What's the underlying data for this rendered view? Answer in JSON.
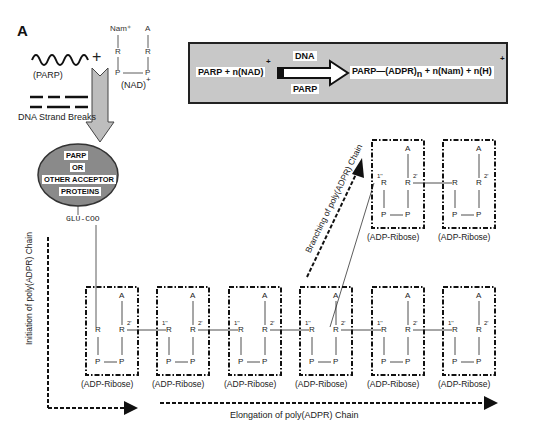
{
  "panel": {
    "letter": "A"
  },
  "reactants": {
    "parp_label": "(PARP)",
    "plus": "+",
    "nad_label": "(NAD)",
    "nad_charge": "+",
    "nad_structure": {
      "top_left": "Nam⁺",
      "top_right": "A",
      "mid_left": "R",
      "mid_right": "R",
      "bot_left": "P",
      "bot_right": "P"
    },
    "dna_breaks_label": "DNA Strand Breaks"
  },
  "reaction": {
    "left": "PARP + n(NAD)",
    "left_charge": "+",
    "arrow_top": "DNA",
    "arrow_bottom": "PARP",
    "right_main": "PARP—(ADPR)",
    "right_sub": "n",
    "right_rest": "+ n(Nam) + n(H)",
    "right_charge": "+"
  },
  "acceptor": {
    "lines": [
      "PARP",
      "OR",
      "OTHER ACCEPTOR",
      "PROTEINS"
    ],
    "attachment": "GLU-COO"
  },
  "axes": {
    "initiation": "Initiation of poly(ADPR) Chain",
    "branching": "Branching of poly(ADPR) Chain",
    "elongation": "Elongation of poly(ADPR) Chain"
  },
  "units": {
    "label": "(ADP-Ribose)",
    "atoms": {
      "A": "A",
      "R": "R",
      "P": "P"
    },
    "pos1": "1''",
    "pos2": "2'",
    "bottom_row_count": 6,
    "branch_row_count": 2
  },
  "colors": {
    "box_fill": "#c8c8c8",
    "ellipse_fill": "#8a8a8a",
    "arrow_fill": "#bdbdbd",
    "line": "#222222"
  }
}
